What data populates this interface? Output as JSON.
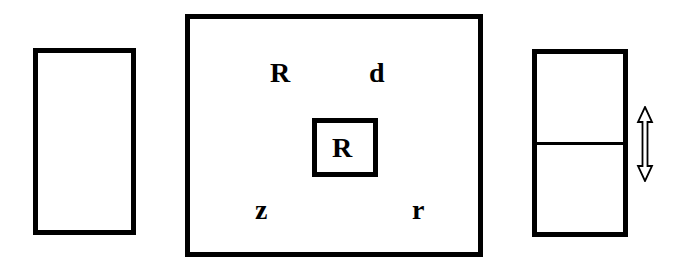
{
  "diagram": {
    "left_panel": {
      "shape": "rectangle",
      "content": ""
    },
    "center_panel": {
      "shape": "rectangle",
      "labels": {
        "top_left": "R",
        "top_right": "d",
        "bottom_left": "z",
        "bottom_right": "r"
      },
      "inner_box": {
        "shape": "rectangle",
        "label": "R"
      }
    },
    "right_panel": {
      "shape": "rectangle",
      "divided": "horizontal",
      "indicator": "double-headed-vertical-arrow-icon"
    },
    "colors": {
      "stroke": "#000000",
      "background": "#ffffff"
    }
  }
}
